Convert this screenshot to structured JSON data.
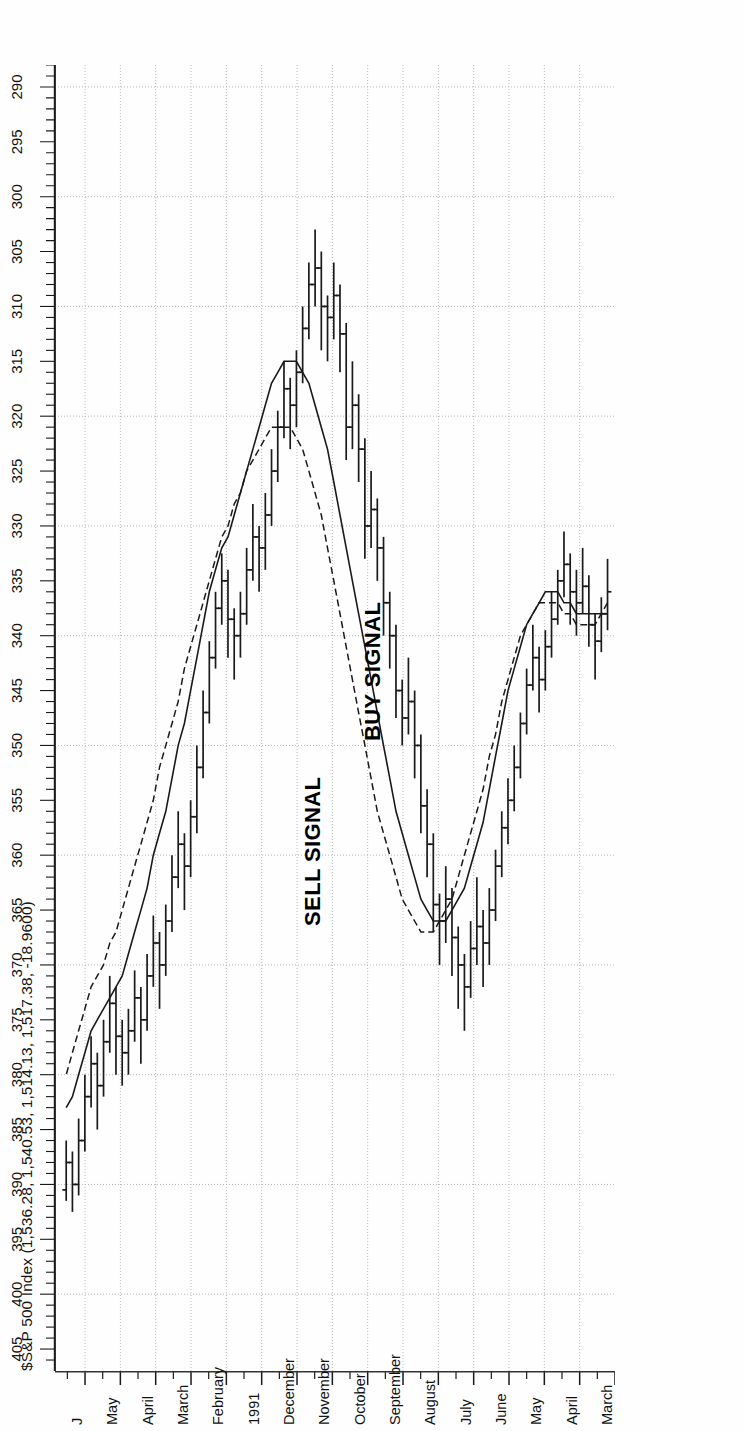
{
  "chart_data": {
    "type": "ohlc",
    "title": "$S&P 500 Index (1,536.28, 1,540.53, 1,514.13, 1,517.38, -18.9600)",
    "xlabel": "",
    "ylabel": "",
    "ylim": [
      288,
      407
    ],
    "y_major_step": 5,
    "y_minor_step": 1,
    "grid": true,
    "grid_style": "dotted-horizontal-and-month-verticals",
    "orientation": "rotated-90-ccw",
    "y_tick_labels": [
      "405",
      "400",
      "395",
      "390",
      "385",
      "380",
      "375",
      "370",
      "365",
      "360",
      "355",
      "350",
      "345",
      "340",
      "335",
      "330",
      "325",
      "320",
      "315",
      "310",
      "305",
      "300",
      "295",
      "290"
    ],
    "x_tick_labels": [
      "March",
      "April",
      "May",
      "June",
      "July",
      "August",
      "September",
      "October",
      "November",
      "December",
      "1991",
      "February",
      "March",
      "April",
      "May",
      "J"
    ],
    "legend_position": "none",
    "annotations": [
      {
        "text": "SELL SIGNAL",
        "kind": "signal"
      },
      {
        "text": "BUY SIGNAL",
        "kind": "signal"
      }
    ],
    "series": [
      {
        "name": "price-bars",
        "type": "ohlc-weekly",
        "bars": [
          {
            "o": 336.0,
            "h": 339.5,
            "l": 333.0,
            "c": 338.0
          },
          {
            "o": 338.0,
            "h": 341.5,
            "l": 336.5,
            "c": 340.5
          },
          {
            "o": 340.5,
            "h": 344.0,
            "l": 338.0,
            "c": 339.0
          },
          {
            "o": 339.0,
            "h": 341.0,
            "l": 334.5,
            "c": 335.5
          },
          {
            "o": 335.5,
            "h": 338.0,
            "l": 332.0,
            "c": 337.0
          },
          {
            "o": 337.0,
            "h": 340.0,
            "l": 334.0,
            "c": 336.0
          },
          {
            "o": 336.0,
            "h": 339.0,
            "l": 332.5,
            "c": 333.5
          },
          {
            "o": 333.5,
            "h": 336.5,
            "l": 330.5,
            "c": 335.0
          },
          {
            "o": 335.0,
            "h": 339.0,
            "l": 334.0,
            "c": 338.5
          },
          {
            "o": 338.5,
            "h": 342.0,
            "l": 336.0,
            "c": 341.0
          },
          {
            "o": 341.0,
            "h": 345.0,
            "l": 339.5,
            "c": 344.0
          },
          {
            "o": 344.0,
            "h": 347.0,
            "l": 341.0,
            "c": 342.0
          },
          {
            "o": 342.0,
            "h": 345.0,
            "l": 339.0,
            "c": 344.5
          },
          {
            "o": 344.5,
            "h": 349.0,
            "l": 343.0,
            "c": 348.0
          },
          {
            "o": 348.0,
            "h": 353.0,
            "l": 347.0,
            "c": 352.0
          },
          {
            "o": 352.0,
            "h": 356.0,
            "l": 350.0,
            "c": 355.0
          },
          {
            "o": 355.0,
            "h": 359.0,
            "l": 353.0,
            "c": 357.5
          },
          {
            "o": 357.5,
            "h": 362.0,
            "l": 356.0,
            "c": 361.0
          },
          {
            "o": 361.0,
            "h": 366.0,
            "l": 359.5,
            "c": 365.0
          },
          {
            "o": 365.0,
            "h": 370.0,
            "l": 363.0,
            "c": 368.0
          },
          {
            "o": 368.0,
            "h": 372.0,
            "l": 365.0,
            "c": 366.5
          },
          {
            "o": 366.5,
            "h": 370.0,
            "l": 362.0,
            "c": 368.5
          },
          {
            "o": 368.5,
            "h": 373.0,
            "l": 366.0,
            "c": 372.0
          },
          {
            "o": 372.0,
            "h": 376.0,
            "l": 369.0,
            "c": 370.0
          },
          {
            "o": 370.0,
            "h": 374.0,
            "l": 366.5,
            "c": 367.5
          },
          {
            "o": 367.5,
            "h": 371.0,
            "l": 363.0,
            "c": 364.0
          },
          {
            "o": 364.0,
            "h": 368.0,
            "l": 361.0,
            "c": 366.0
          },
          {
            "o": 366.0,
            "h": 370.0,
            "l": 363.5,
            "c": 364.5
          },
          {
            "o": 364.5,
            "h": 367.0,
            "l": 358.0,
            "c": 359.0
          },
          {
            "o": 359.0,
            "h": 362.0,
            "l": 354.0,
            "c": 355.5
          },
          {
            "o": 355.5,
            "h": 358.0,
            "l": 349.0,
            "c": 350.0
          },
          {
            "o": 350.0,
            "h": 353.0,
            "l": 345.0,
            "c": 346.0
          },
          {
            "o": 346.0,
            "h": 349.0,
            "l": 342.0,
            "c": 347.5
          },
          {
            "o": 347.5,
            "h": 350.0,
            "l": 344.0,
            "c": 345.0
          },
          {
            "o": 345.0,
            "h": 347.5,
            "l": 339.0,
            "c": 340.0
          },
          {
            "o": 340.0,
            "h": 343.0,
            "l": 336.0,
            "c": 337.0
          },
          {
            "o": 337.0,
            "h": 340.0,
            "l": 331.0,
            "c": 332.0
          },
          {
            "o": 332.0,
            "h": 335.0,
            "l": 327.5,
            "c": 328.5
          },
          {
            "o": 328.5,
            "h": 332.0,
            "l": 325.0,
            "c": 330.0
          },
          {
            "o": 330.0,
            "h": 333.0,
            "l": 322.0,
            "c": 323.0
          },
          {
            "o": 323.0,
            "h": 326.0,
            "l": 318.0,
            "c": 319.0
          },
          {
            "o": 319.0,
            "h": 323.0,
            "l": 315.0,
            "c": 321.0
          },
          {
            "o": 321.0,
            "h": 324.0,
            "l": 311.5,
            "c": 312.5
          },
          {
            "o": 312.5,
            "h": 316.0,
            "l": 308.0,
            "c": 309.0
          },
          {
            "o": 309.0,
            "h": 313.0,
            "l": 306.0,
            "c": 311.0
          },
          {
            "o": 311.0,
            "h": 315.0,
            "l": 309.0,
            "c": 310.0
          },
          {
            "o": 310.0,
            "h": 314.0,
            "l": 305.0,
            "c": 306.5
          },
          {
            "o": 306.5,
            "h": 310.0,
            "l": 303.0,
            "c": 308.0
          },
          {
            "o": 308.0,
            "h": 313.0,
            "l": 306.0,
            "c": 312.0
          },
          {
            "o": 312.0,
            "h": 317.0,
            "l": 310.0,
            "c": 316.0
          },
          {
            "o": 316.0,
            "h": 321.0,
            "l": 314.0,
            "c": 319.0
          },
          {
            "o": 319.0,
            "h": 323.0,
            "l": 316.5,
            "c": 317.5
          },
          {
            "o": 317.5,
            "h": 322.0,
            "l": 315.0,
            "c": 321.0
          },
          {
            "o": 321.0,
            "h": 326.0,
            "l": 319.5,
            "c": 325.0
          },
          {
            "o": 325.0,
            "h": 330.0,
            "l": 323.0,
            "c": 329.0
          },
          {
            "o": 329.0,
            "h": 334.0,
            "l": 327.0,
            "c": 332.0
          },
          {
            "o": 332.0,
            "h": 336.0,
            "l": 330.0,
            "c": 331.0
          },
          {
            "o": 331.0,
            "h": 335.0,
            "l": 328.0,
            "c": 334.0
          },
          {
            "o": 334.0,
            "h": 339.0,
            "l": 332.0,
            "c": 338.0
          },
          {
            "o": 338.0,
            "h": 342.0,
            "l": 336.0,
            "c": 340.0
          },
          {
            "o": 340.0,
            "h": 344.0,
            "l": 337.5,
            "c": 338.5
          },
          {
            "o": 338.5,
            "h": 342.0,
            "l": 334.0,
            "c": 335.0
          },
          {
            "o": 335.0,
            "h": 339.0,
            "l": 332.5,
            "c": 337.5
          },
          {
            "o": 337.5,
            "h": 343.0,
            "l": 336.0,
            "c": 342.0
          },
          {
            "o": 342.0,
            "h": 348.0,
            "l": 340.5,
            "c": 347.0
          },
          {
            "o": 347.0,
            "h": 353.0,
            "l": 345.0,
            "c": 352.0
          },
          {
            "o": 352.0,
            "h": 358.0,
            "l": 350.0,
            "c": 356.5
          },
          {
            "o": 356.5,
            "h": 362.0,
            "l": 355.0,
            "c": 361.0
          },
          {
            "o": 361.0,
            "h": 365.0,
            "l": 358.0,
            "c": 359.0
          },
          {
            "o": 359.0,
            "h": 363.0,
            "l": 356.0,
            "c": 362.0
          },
          {
            "o": 362.0,
            "h": 367.0,
            "l": 360.0,
            "c": 366.0
          },
          {
            "o": 366.0,
            "h": 371.0,
            "l": 364.5,
            "c": 370.0
          },
          {
            "o": 370.0,
            "h": 374.0,
            "l": 367.0,
            "c": 368.0
          },
          {
            "o": 368.0,
            "h": 372.0,
            "l": 365.5,
            "c": 371.0
          },
          {
            "o": 371.0,
            "h": 376.0,
            "l": 369.0,
            "c": 375.0
          },
          {
            "o": 375.0,
            "h": 379.0,
            "l": 372.0,
            "c": 373.0
          },
          {
            "o": 373.0,
            "h": 377.0,
            "l": 370.5,
            "c": 376.0
          },
          {
            "o": 376.0,
            "h": 380.0,
            "l": 374.0,
            "c": 378.0
          },
          {
            "o": 378.0,
            "h": 381.0,
            "l": 375.0,
            "c": 376.5
          },
          {
            "o": 376.5,
            "h": 380.0,
            "l": 372.0,
            "c": 373.5
          },
          {
            "o": 373.5,
            "h": 378.0,
            "l": 371.0,
            "c": 377.0
          },
          {
            "o": 377.0,
            "h": 382.0,
            "l": 375.0,
            "c": 381.0
          },
          {
            "o": 381.0,
            "h": 385.0,
            "l": 378.0,
            "c": 379.0
          },
          {
            "o": 379.0,
            "h": 383.0,
            "l": 376.5,
            "c": 382.0
          },
          {
            "o": 382.0,
            "h": 387.0,
            "l": 380.0,
            "c": 386.0
          },
          {
            "o": 386.0,
            "h": 391.0,
            "l": 384.0,
            "c": 390.0
          },
          {
            "o": 390.0,
            "h": 392.5,
            "l": 387.0,
            "c": 388.0
          },
          {
            "o": 388.0,
            "h": 391.5,
            "l": 386.0,
            "c": 390.5
          }
        ]
      },
      {
        "name": "moving-average-fast",
        "type": "line",
        "style": "solid",
        "values": [
          338,
          338,
          338,
          338,
          338,
          338,
          337,
          337,
          336,
          336,
          336,
          337,
          338,
          339,
          341,
          343,
          345,
          348,
          351,
          354,
          357,
          359,
          361,
          363,
          364,
          365,
          366,
          366,
          366,
          365,
          364,
          362,
          360,
          358,
          356,
          353,
          350,
          347,
          344,
          341,
          338,
          335,
          332,
          329,
          326,
          323,
          321,
          319,
          317,
          316,
          315,
          315,
          315,
          316,
          317,
          319,
          321,
          323,
          325,
          327,
          329,
          331,
          332,
          334,
          336,
          339,
          342,
          345,
          348,
          350,
          353,
          356,
          358,
          360,
          363,
          365,
          367,
          369,
          371,
          372,
          373,
          374,
          375,
          376,
          378,
          380,
          382,
          383
        ]
      },
      {
        "name": "moving-average-slow",
        "type": "line",
        "style": "dashed",
        "values": [
          337,
          338,
          339,
          339,
          339,
          339,
          338,
          338,
          337,
          337,
          337,
          337,
          338,
          339,
          340,
          342,
          344,
          346,
          349,
          351,
          354,
          356,
          358,
          360,
          362,
          364,
          365,
          366,
          367,
          367,
          367,
          366,
          365,
          364,
          362,
          360,
          358,
          356,
          353,
          350,
          347,
          344,
          341,
          338,
          335,
          332,
          329,
          327,
          325,
          323,
          322,
          321,
          321,
          321,
          321,
          322,
          323,
          324,
          325,
          327,
          328,
          330,
          331,
          333,
          335,
          337,
          339,
          341,
          343,
          346,
          348,
          350,
          352,
          355,
          357,
          359,
          361,
          363,
          365,
          367,
          368,
          370,
          371,
          372,
          374,
          376,
          378,
          380
        ]
      }
    ]
  },
  "title": {
    "text": "$S&P 500 Index (1,536.28, 1,540.53, 1,514.13, 1,517.38, -18.9600)"
  },
  "annotations": {
    "sell": "SELL SIGNAL",
    "buy": "BUY SIGNAL"
  },
  "colors": {
    "background": "#fefefe",
    "ink": "#1a1a1a",
    "grid": "#b9b9b9",
    "axis": "#333333"
  }
}
